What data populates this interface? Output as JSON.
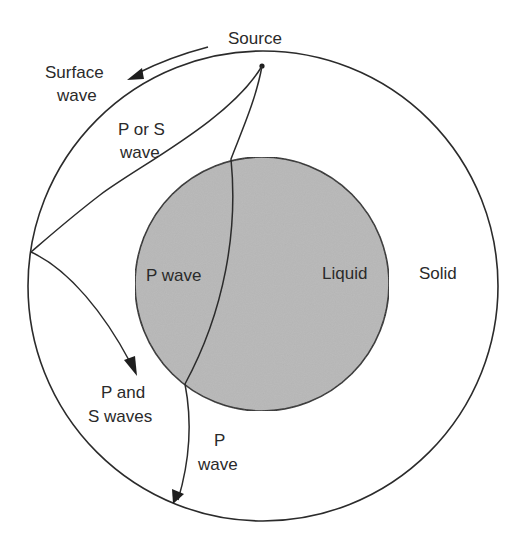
{
  "diagram": {
    "colors": {
      "background": "#ffffff",
      "core_fill": "#b8b8b8",
      "line": "#2b2b2b",
      "text": "#2a2a2a"
    },
    "labels": {
      "source": "Source",
      "surface_wave_line1": "Surface",
      "surface_wave_line2": "wave",
      "p_or_s_line1": "P or S",
      "p_or_s_line2": "wave",
      "p_wave_core": "P wave",
      "liquid": "Liquid",
      "solid": "Solid",
      "p_and_s_line1": "P and",
      "p_and_s_line2": "S waves",
      "p_wave_lower_line1": "P",
      "p_wave_lower_line2": "wave"
    },
    "regions": [
      {
        "name": "mantle",
        "state": "Solid"
      },
      {
        "name": "core",
        "state": "Liquid"
      }
    ]
  }
}
